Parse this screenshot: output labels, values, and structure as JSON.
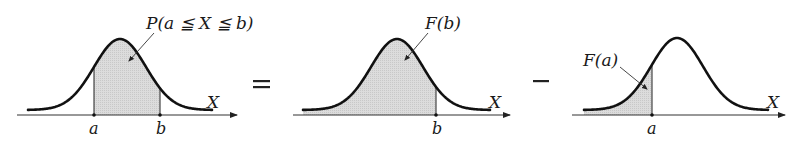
{
  "panels": [
    {
      "id": "interval",
      "annotation": "P(a ≦ X ≦ b)",
      "axis_label": "X",
      "ticks": [
        "a",
        "b"
      ],
      "shaded": "between a and b"
    },
    {
      "id": "cdf-b",
      "annotation": "F(b)",
      "axis_label": "X",
      "ticks": [
        "b"
      ],
      "shaded": "left of b"
    },
    {
      "id": "cdf-a",
      "annotation": "F(a)",
      "axis_label": "X",
      "ticks": [
        "a"
      ],
      "shaded": "left of a"
    }
  ],
  "operators": {
    "equals": "=",
    "minus": "−"
  },
  "colors": {
    "curve": "#111111",
    "axis": "#333333",
    "shade": "#d9d9d9"
  }
}
